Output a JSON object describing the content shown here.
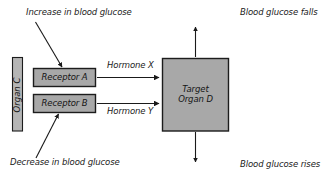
{
  "diagram": {
    "title_text": "Blood glucose hormonal control diagram",
    "annotations": {
      "increase": "Increase in blood glucose",
      "decrease": "Decrease in blood glucose",
      "falls": "Blood glucose falls",
      "rises": "Blood glucose rises"
    },
    "nodes": {
      "organ_c": "Organ C",
      "receptor_a": "Receptor A",
      "receptor_b": "Receptor B",
      "target_organ_line1": "Target",
      "target_organ_line2": "Organ D"
    },
    "edges": {
      "hormone_x": "Hormone X",
      "hormone_y": "Hormone Y"
    },
    "colors": {
      "box_fill": "#a8a8a8",
      "box_stroke": "#1c1c1c",
      "organ_fill": "#b5b5b5",
      "arrow": "#1a1a1a",
      "text": "#1a1a1a",
      "background": "#ffffff"
    }
  }
}
